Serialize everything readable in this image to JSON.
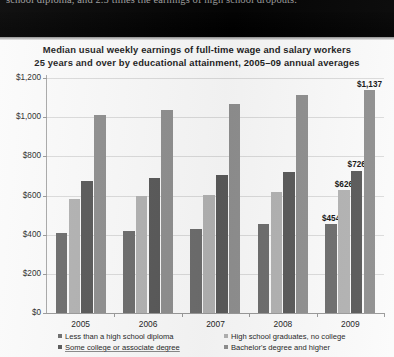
{
  "document_strip": {
    "text": "school diploma, and 2.5 times the earnings of high school dropouts."
  },
  "chart_data": {
    "type": "bar",
    "title": "Median usual weekly earnings of full-time wage and salary workers",
    "subtitle": "25 years and over by educational attainment, 2005–09 annual averages",
    "title_line1": "Median usual weekly earnings of full-time wage and salary workers",
    "title_line2": "25 years and over by educational attainment, 2005–09 annual averages",
    "xlabel": "",
    "ylabel": "",
    "ylim": [
      0,
      1200
    ],
    "ytick_values": [
      0,
      200,
      400,
      600,
      800,
      1000,
      1200
    ],
    "ytick_labels": [
      "$0",
      "$200",
      "$400",
      "$600",
      "$800",
      "$1,000",
      "$1,200"
    ],
    "categories": [
      "2005",
      "2006",
      "2007",
      "2008",
      "2009"
    ],
    "grid": true,
    "legend_position": "bottom",
    "series": [
      {
        "name": "Less than a high school diploma",
        "color": "#6e6e6e",
        "values": [
          409,
          419,
          428,
          453,
          454
        ],
        "labels": [
          "",
          "",
          "",
          "",
          "$454"
        ]
      },
      {
        "name": "High school graduates, no college",
        "color": "#b3b3b3",
        "values": [
          583,
          595,
          604,
          618,
          626
        ],
        "labels": [
          "",
          "",
          "",
          "",
          "$626"
        ]
      },
      {
        "name": "Some college or associate degree",
        "color": "#5a5a5a",
        "values": [
          672,
          690,
          704,
          722,
          726
        ],
        "labels": [
          "",
          "",
          "",
          "",
          "$726"
        ]
      },
      {
        "name": "Bachelor's degree and higher",
        "color": "#909090",
        "values": [
          1011,
          1039,
          1065,
          1115,
          1137
        ],
        "labels": [
          "",
          "",
          "",
          "",
          "$1,137"
        ]
      }
    ]
  }
}
